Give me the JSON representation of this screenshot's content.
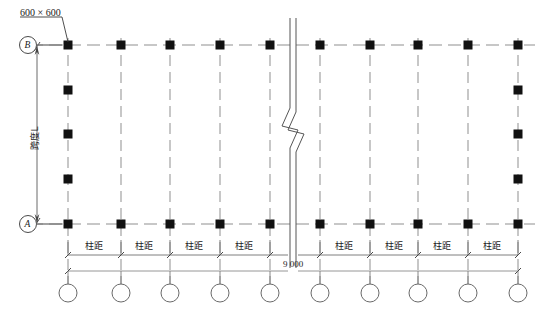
{
  "drawing": {
    "type": "structural-column-layout-plan",
    "annotations": {
      "column_size_note": "600 × 600",
      "span_label": "跨度L",
      "bay_label": "柱距",
      "center_dimension": "9 000"
    },
    "grid_bubbles": {
      "vertical": [
        {
          "id": "bubble-b",
          "label": "B",
          "position": "top-left"
        },
        {
          "id": "bubble-a",
          "label": "A",
          "position": "bottom-left"
        }
      ],
      "horizontal_count": 10,
      "horizontal_labels": [
        "",
        "",
        "",
        "",
        "",
        "",
        "",
        "",
        "",
        ""
      ]
    },
    "bay_labels": [
      "柱距",
      "柱距",
      "柱距",
      "柱距",
      "柱距",
      "柱距",
      "柱距",
      "柱距"
    ],
    "columns": {
      "shape": "filled-square",
      "size_px": 9,
      "color": "#111111",
      "top_row_x": [
        68,
        121,
        170,
        220,
        270,
        320,
        370,
        418,
        468,
        518
      ],
      "bottom_row_x": [
        68,
        121,
        170,
        220,
        270,
        320,
        370,
        418,
        468,
        518
      ],
      "top_row_y": 45,
      "bottom_row_y": 224,
      "left_edge_y": [
        45,
        90,
        134,
        179,
        224
      ],
      "right_edge_y": [
        45,
        90,
        134,
        179,
        224
      ],
      "left_edge_x": 68,
      "right_edge_x": 518
    },
    "break_line": {
      "x_left": 290,
      "x_right": 296,
      "zigzag_y": 118
    },
    "colors": {
      "column_fill": "#111111",
      "grid_line": "#8f8f8f",
      "dim_line": "#6f6f6f",
      "text": "#1a1a1a"
    }
  }
}
